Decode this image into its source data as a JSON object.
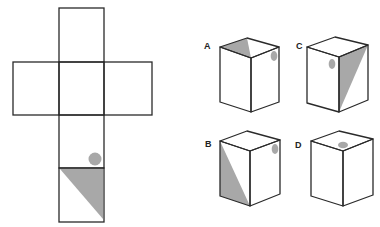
{
  "colors": {
    "line": "#2a2a2a",
    "shade": "#a8a8a8",
    "background": "#ffffff"
  },
  "net": {
    "description": "Cross-shaped cube net with six squares; bottom square contains shaded triangle and a gray dot",
    "faces": 6,
    "marked_face": {
      "position": "bottom",
      "shapes": [
        "triangle",
        "circle"
      ]
    }
  },
  "options": [
    {
      "label": "A",
      "shading": "top face triangle",
      "dot": "right face, upper right"
    },
    {
      "label": "C",
      "shading": "right face triangle",
      "dot": "left face, upper left"
    },
    {
      "label": "B",
      "shading": "left face triangle",
      "dot": "right face, upper right"
    },
    {
      "label": "D",
      "shading": "none",
      "dot": "top face, near front"
    }
  ]
}
